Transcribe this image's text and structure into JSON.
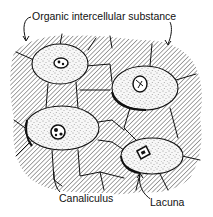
{
  "figure": {
    "labels": {
      "intercellular": "Organic intercellular substance",
      "canaliculus": "Canaliculus",
      "lacuna": "Lacuna"
    },
    "components": [
      {
        "name": "intercellular-substance",
        "style": "diagonal hatching"
      },
      {
        "name": "cell",
        "count": 4,
        "style": "stippled ellipse with nucleus"
      },
      {
        "name": "canaliculi",
        "style": "thin connecting lines between cells"
      }
    ],
    "colors": {
      "ink": "#111111",
      "background": "#ffffff",
      "hatch": "#555555",
      "cell_fill": "#f4f4f4"
    }
  }
}
